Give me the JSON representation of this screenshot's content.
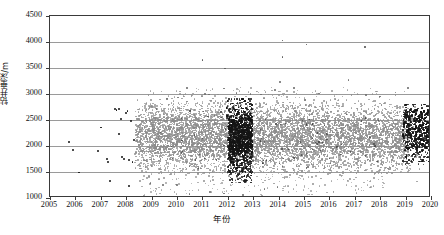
{
  "chart_data": {
    "type": "scatter",
    "title": "",
    "xlabel": "年份",
    "ylabel": "钻井垂深/m",
    "xlim": [
      2005,
      2020
    ],
    "ylim": [
      1000,
      4500
    ],
    "xticks": [
      "2005",
      "2006",
      "2007",
      "2008",
      "2009",
      "2010",
      "2011",
      "2012",
      "2013",
      "2014",
      "2015",
      "2016",
      "2017",
      "2018",
      "2019",
      "2020"
    ],
    "yticks": [
      "1000",
      "1500",
      "2000",
      "2500",
      "3000",
      "3500",
      "4000",
      "4500"
    ],
    "grid": "horizontal",
    "legend": "none",
    "series": [
      {
        "name": "gray-wells",
        "color": "#8c8c8c",
        "description": "Dense gray cloud of drilling vertical depths, bulk from 2008.4 to 2019, concentrated between 1500 and 2700 m",
        "point_count_approx": 4200
      },
      {
        "name": "black-wells",
        "color": "#141414",
        "description": "Black points: sparse scatter 2005-2008, dense vertical band 2012.0-2013.0, and dense cluster 2019-2020",
        "point_count_approx": 1100
      }
    ],
    "annotations": [
      {
        "label": "sparse early black points",
        "x_range": [
          2005.6,
          2008.3
        ],
        "y_range": [
          1300,
          2750
        ]
      },
      {
        "label": "gray cloud onset",
        "x": 2008.4
      },
      {
        "label": "dense black band",
        "x_range": [
          2012.0,
          2013.0
        ],
        "y_range": [
          1300,
          2800
        ]
      },
      {
        "label": "black end cluster",
        "x_range": [
          2018.9,
          2020.0
        ],
        "y_range": [
          1850,
          2750
        ]
      },
      {
        "label": "high outlier",
        "x": 2014.15,
        "y": 4030
      },
      {
        "label": "high outlier",
        "x": 2015.1,
        "y": 3950
      },
      {
        "label": "high outlier",
        "x": 2017.4,
        "y": 3910
      },
      {
        "label": "high outlier",
        "x": 2011.0,
        "y": 3660
      },
      {
        "label": "high outlier",
        "x": 2014.15,
        "y": 3710
      },
      {
        "label": "high outlier",
        "x": 2011.9,
        "y": 3490
      },
      {
        "label": "high outlier",
        "x": 2019.95,
        "y": 3520
      }
    ]
  },
  "axes": {
    "x_title": "年份",
    "y_title": "钻井垂深/m",
    "x_tick_labels": [
      "2005",
      "2006",
      "2007",
      "2008",
      "2009",
      "2010",
      "2011",
      "2012",
      "2013",
      "2014",
      "2015",
      "2016",
      "2017",
      "2018",
      "2019",
      "2020"
    ],
    "y_tick_labels": [
      "4500",
      "4000",
      "3500",
      "3000",
      "2500",
      "2000",
      "1500",
      "1000"
    ]
  },
  "colors": {
    "gray_series": "#8c8c8c",
    "black_series": "#141414",
    "gridline": "#9a9a9a",
    "axis": "#3a3a3a",
    "background": "#ffffff"
  }
}
